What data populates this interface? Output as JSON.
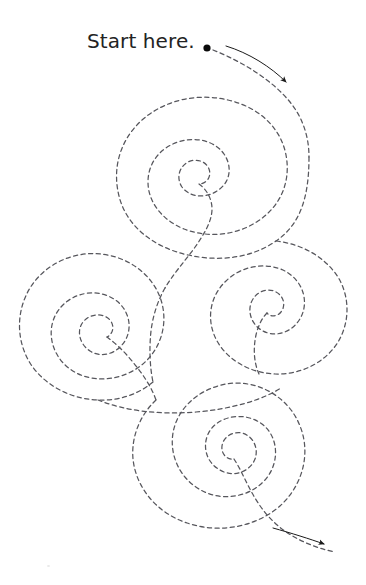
{
  "page": {
    "title": "Start here.",
    "width": 366,
    "height": 585,
    "background_color": "#ffffff"
  },
  "labels": {
    "start_here": "Start here."
  },
  "colors": {
    "ink": "#232323",
    "dashed_path": "#56565c",
    "arrow": "#1a1a1a",
    "dot": "#0a0a0a",
    "speck": "#e9e9e9"
  },
  "markers": {
    "start_dot": {
      "name": "start-dot",
      "cx": 207,
      "cy": 48,
      "r": 3.6
    }
  },
  "style": {
    "dash_array": "4.2 3.4",
    "dash_width": 1.25,
    "arrow_line_width": 1.0
  },
  "diagram": {
    "spirals": [
      {
        "name": "spiral-top",
        "cx": 203,
        "cy": 175,
        "turns": 2.6,
        "outer_r": 86,
        "direction": "inward-clockwise"
      },
      {
        "name": "spiral-left",
        "cx": 116,
        "cy": 336,
        "turns": 2.6,
        "outer_r": 94,
        "direction": "inward-clockwise"
      },
      {
        "name": "spiral-right-middle",
        "cx": 277,
        "cy": 308,
        "turns": 2.4,
        "outer_r": 72,
        "direction": "inward-clockwise"
      },
      {
        "name": "spiral-bottom",
        "cx": 213,
        "cy": 456,
        "turns": 2.6,
        "outer_r": 92,
        "direction": "inward-clockwise"
      }
    ],
    "arrows": [
      {
        "name": "direction-arrow-top",
        "from_x": 226,
        "from_y": 46,
        "to_x": 289,
        "to_y": 83,
        "points": "down-right"
      },
      {
        "name": "direction-arrow-bottom",
        "from_x": 273,
        "from_y": 528,
        "to_x": 327,
        "to_y": 545,
        "points": "down-right"
      }
    ]
  }
}
